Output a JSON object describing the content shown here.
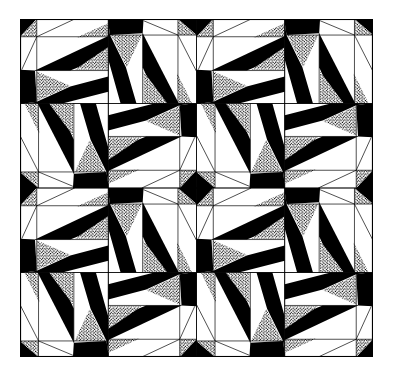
{
  "figure": {
    "kind": "quilt-pattern",
    "grid": {
      "large_blocks_cols": 2,
      "large_blocks_rows": 2,
      "sub_blocks_per_block": 4
    },
    "colors": {
      "ink": "#000000",
      "paper": "#ffffff",
      "speckle": "#000000"
    },
    "frame": {
      "x": 20,
      "y": 19,
      "width": 353,
      "height": 338
    }
  },
  "tile": {
    "black": [
      [
        [
          0,
          0
        ],
        [
          19,
          0
        ],
        [
          0,
          21
        ]
      ],
      [
        [
          17,
          61
        ],
        [
          100,
          20
        ],
        [
          100,
          43
        ],
        [
          57,
          61
        ]
      ],
      [
        [
          5,
          100
        ],
        [
          19,
          98
        ],
        [
          57,
          80
        ],
        [
          100,
          68
        ],
        [
          100,
          86
        ],
        [
          48,
          100
        ]
      ],
      [
        [
          0,
          60
        ],
        [
          17,
          61
        ],
        [
          19,
          98
        ],
        [
          5,
          100
        ],
        [
          0,
          100
        ]
      ]
    ],
    "speckle": [
      [
        [
          19,
          0
        ],
        [
          19,
          21
        ],
        [
          0,
          21
        ]
      ],
      [
        [
          64,
          22
        ],
        [
          100,
          5
        ],
        [
          100,
          20
        ]
      ],
      [
        [
          62,
          60
        ],
        [
          100,
          33
        ],
        [
          100,
          60
        ]
      ],
      [
        [
          19,
          62
        ],
        [
          57,
          79
        ],
        [
          19,
          97
        ]
      ]
    ],
    "lines": [
      [
        [
          0,
          21
        ],
        [
          100,
          21
        ]
      ],
      [
        [
          19,
          0
        ],
        [
          19,
          100
        ]
      ],
      [
        [
          19,
          21
        ],
        [
          62,
          0
        ]
      ],
      [
        [
          19,
          21
        ],
        [
          2,
          60
        ]
      ],
      [
        [
          17,
          61
        ],
        [
          100,
          61
        ]
      ]
    ],
    "rotations": [
      0,
      90,
      270,
      180
    ]
  }
}
